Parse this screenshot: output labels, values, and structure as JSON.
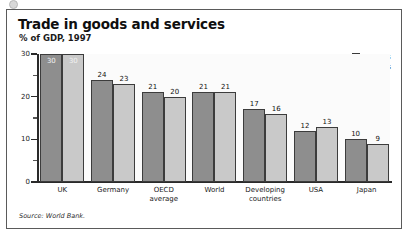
{
  "chart_data": {
    "type": "bar",
    "title": "Trade in goods and services",
    "subtitle": "% of GDP, 1997",
    "xlabel": "",
    "ylabel": "",
    "ylim": [
      0,
      30
    ],
    "yticks": [
      0,
      10,
      20,
      30
    ],
    "ytick_labels": [
      "0",
      "10",
      "20",
      "30"
    ],
    "yminor_ticks": [
      5,
      15,
      25
    ],
    "grid": false,
    "legend_position": "top-right",
    "categories": [
      "UK",
      "Germany",
      "OECD average",
      "World",
      "Developing countries",
      "USA",
      "Japan"
    ],
    "category_lines": [
      [
        "UK"
      ],
      [
        "Germany"
      ],
      [
        "OECD",
        "average"
      ],
      [
        "World"
      ],
      [
        "Developing",
        "countries"
      ],
      [
        "USA"
      ],
      [
        "Japan"
      ]
    ],
    "series": [
      {
        "name": "Exports",
        "color": "#8e8e8e",
        "values": [
          30,
          24,
          21,
          21,
          17,
          12,
          10
        ]
      },
      {
        "name": "Imports",
        "color": "#c9c9c9",
        "values": [
          30,
          23,
          20,
          21,
          16,
          13,
          9
        ]
      }
    ],
    "source": "Source: World Bank."
  },
  "legend": {
    "items": [
      {
        "label": "Exports",
        "swatch": "exports"
      },
      {
        "label": "Imports",
        "swatch": "imports"
      }
    ]
  }
}
